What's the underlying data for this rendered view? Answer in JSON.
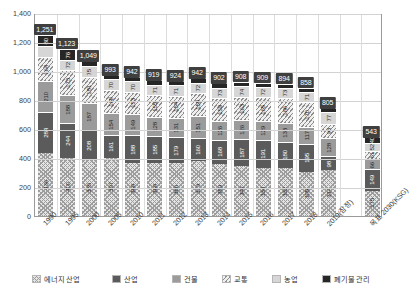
{
  "chart_data": {
    "type": "bar",
    "stacked": true,
    "title": "",
    "xlabel": "",
    "ylabel": "",
    "ylim": [
      0,
      1400
    ],
    "yticks": [
      "0",
      "200",
      "400",
      "600",
      "800",
      "1,000",
      "1,200",
      "1,400"
    ],
    "grid": true,
    "legend_position": "bottom",
    "categories": [
      "1990",
      "1995",
      "2000",
      "2005",
      "2010",
      "2011",
      "2012",
      "2013",
      "2014",
      "2015",
      "2016",
      "2017",
      "2018",
      "2019(잠정)",
      "",
      "목표 2030(KSG)"
    ],
    "totals": [
      "1,251",
      "1,123",
      "1,049",
      "993",
      "942",
      "919",
      "924",
      "942",
      "902",
      "908",
      "909",
      "894",
      "858",
      "805",
      "",
      "543"
    ],
    "series": [
      {
        "name": "에너지 산업",
        "fill": "f-energy",
        "values": [
          436,
          400,
          385,
          397,
          368,
          368,
          366,
          379,
          359,
          347,
          334,
          332,
          305,
          314,
          null,
          175
        ]
      },
      {
        "name": "산업",
        "fill": "f-industry",
        "values": [
          284,
          244,
          208,
          161,
          188,
          185,
          179,
          160,
          168,
          187,
          191,
          180,
          195,
          98,
          null,
          149
        ]
      },
      {
        "name": "건물",
        "fill": "f-building",
        "values": [
          210,
          188,
          187,
          154,
          149,
          128,
          131,
          151,
          126,
          126,
          129,
          133,
          117,
          128,
          null,
          66
        ]
      },
      {
        "name": "교통",
        "fill": "f-transport",
        "values": [
          164,
          173,
          181,
          160,
          153,
          155,
          154,
          158,
          159,
          163,
          165,
          166,
          170,
          98,
          null,
          61
        ]
      },
      {
        "name": "농업",
        "fill": "f-agri",
        "values": [
          77,
          72,
          75,
          70,
          70,
          71,
          71,
          72,
          73,
          74,
          72,
          73,
          71,
          77,
          null,
          52
        ]
      },
      {
        "name": "폐기물 관리",
        "fill": "f-waste",
        "values": [
          80,
          76,
          30,
          30,
          30,
          30,
          30,
          30,
          30,
          30,
          29,
          28,
          27,
          27,
          null,
          40
        ]
      }
    ],
    "segment_labels": [
      [
        "436",
        "284",
        "210",
        "164",
        "",
        "80"
      ],
      [
        "400",
        "244",
        "188",
        "173",
        "72",
        "76"
      ],
      [
        "385",
        "208",
        "187",
        "181",
        "75",
        ""
      ],
      [
        "397",
        "161",
        "154",
        "160",
        "70",
        ""
      ],
      [
        "368",
        "188",
        "149",
        "153",
        "70",
        ""
      ],
      [
        "368",
        "185",
        "128",
        "155",
        "71",
        ""
      ],
      [
        "366",
        "179",
        "131",
        "154",
        "71",
        ""
      ],
      [
        "379",
        "160",
        "151",
        "158",
        "72",
        ""
      ],
      [
        "359",
        "168",
        "126",
        "159",
        "73",
        ""
      ],
      [
        "347",
        "187",
        "126",
        "163",
        "74",
        ""
      ],
      [
        "334",
        "191",
        "129",
        "165",
        "72",
        ""
      ],
      [
        "332",
        "180",
        "133",
        "166",
        "73",
        ""
      ],
      [
        "305",
        "195",
        "117",
        "170",
        "71",
        ""
      ],
      [
        "314",
        "98",
        "128",
        "98",
        "77",
        ""
      ],
      [
        "",
        "",
        "",
        "",
        "",
        ""
      ],
      [
        "175",
        "149",
        "66",
        "61",
        "52",
        "40"
      ]
    ]
  },
  "legend": {
    "items": [
      {
        "label": "에너지 산업",
        "fill": "f-energy"
      },
      {
        "label": "산업",
        "fill": "f-industry"
      },
      {
        "label": "건물",
        "fill": "f-building"
      },
      {
        "label": "교통",
        "fill": "f-transport"
      },
      {
        "label": "농업",
        "fill": "f-agri"
      },
      {
        "label": "폐기물 관리",
        "fill": "f-waste"
      }
    ]
  }
}
